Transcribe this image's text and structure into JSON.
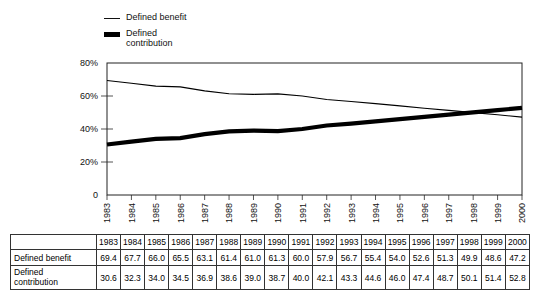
{
  "legend": {
    "items": [
      {
        "label": "Defined benefit",
        "marker": "thin-line",
        "color": "#111111"
      },
      {
        "label": "Defined\ncontribution",
        "marker": "thick-block",
        "color": "#000000"
      }
    ]
  },
  "chart_data": {
    "type": "line",
    "title": "",
    "xlabel": "",
    "ylabel": "",
    "ylim": [
      0,
      80
    ],
    "ytick_labels": [
      "0",
      "20%",
      "40%",
      "60%",
      "80%"
    ],
    "ytick_values": [
      0,
      20,
      40,
      60,
      80
    ],
    "grid": false,
    "legend_position": "top-left",
    "categories": [
      "1983",
      "1984",
      "1985",
      "1986",
      "1987",
      "1988",
      "1989",
      "1990",
      "1991",
      "1992",
      "1993",
      "1994",
      "1995",
      "1996",
      "1997",
      "1998",
      "1999",
      "2000"
    ],
    "series": [
      {
        "name": "Defined benefit",
        "style": "thin",
        "values": [
          69.4,
          67.7,
          66.0,
          65.5,
          63.1,
          61.4,
          61.0,
          61.3,
          60.0,
          57.9,
          56.7,
          55.4,
          54.0,
          52.6,
          51.3,
          49.9,
          48.6,
          47.2
        ]
      },
      {
        "name": "Defined contribution",
        "style": "thick",
        "values": [
          30.6,
          32.3,
          34.0,
          34.5,
          36.9,
          38.6,
          39.0,
          38.7,
          40.0,
          42.1,
          43.3,
          44.6,
          46.0,
          47.4,
          48.7,
          50.1,
          51.4,
          52.8
        ]
      }
    ]
  },
  "table": {
    "corner_label": "",
    "column_headers": [
      "1983",
      "1984",
      "1985",
      "1986",
      "1987",
      "1988",
      "1989",
      "1990",
      "1991",
      "1992",
      "1993",
      "1994",
      "1995",
      "1996",
      "1997",
      "1998",
      "1999",
      "2000"
    ],
    "rows": [
      {
        "label": "Defined benefit",
        "values": [
          "69.4",
          "67.7",
          "66.0",
          "65.5",
          "63.1",
          "61.4",
          "61.0",
          "61.3",
          "60.0",
          "57.9",
          "56.7",
          "55.4",
          "54.0",
          "52.6",
          "51.3",
          "49.9",
          "48.6",
          "47.2"
        ]
      },
      {
        "label": "Defined\ncontribution",
        "values": [
          "30.6",
          "32.3",
          "34.0",
          "34.5",
          "36.9",
          "38.6",
          "39.0",
          "38.7",
          "40.0",
          "42.1",
          "43.3",
          "44.6",
          "46.0",
          "47.4",
          "48.7",
          "50.1",
          "51.4",
          "52.8"
        ]
      }
    ]
  }
}
